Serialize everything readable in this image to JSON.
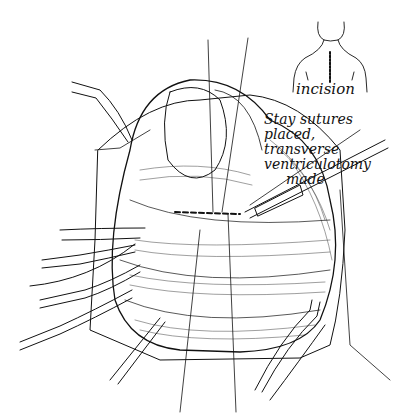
{
  "figure": {
    "type": "surgical-illustration",
    "style": "black ink line drawing on white",
    "colors": {
      "ink": "#111111",
      "background": "#ffffff"
    },
    "inset": {
      "subject": "torso outline with midline sternotomy",
      "label": "incision"
    },
    "annotation": {
      "lines": [
        "Stay sutures",
        "placed, transverse",
        "ventriculotomy",
        "made"
      ]
    }
  }
}
